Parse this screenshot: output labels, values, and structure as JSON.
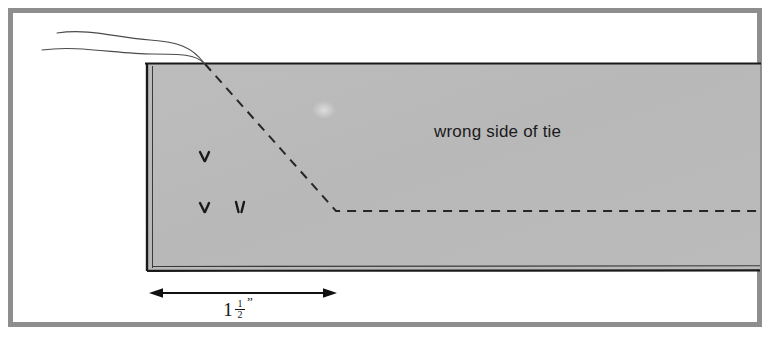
{
  "figure": {
    "kind": "sewing-instruction-diagram",
    "subject": "tie",
    "background_color": "#ffffff",
    "frame": {
      "name": "outer-border",
      "color": "#8e8e8e",
      "x": 8,
      "y": 8,
      "width": 752,
      "height": 318,
      "stroke_width": 5
    },
    "fabric": {
      "name": "tie-fabric-panel",
      "fill_color": "#b9b9b9",
      "outline_color": "#1a1a1a",
      "x": 146,
      "y": 63,
      "width": 614,
      "height": 208
    },
    "labels": {
      "fabric_side": "wrong side of tie"
    },
    "dimension": {
      "name": "seam-allowance-dimension",
      "whole": "1",
      "numerator": "1",
      "denominator": "2",
      "unit_mark": "”",
      "full_text": "1½”",
      "from_x": 150,
      "to_x": 336,
      "y": 293
    },
    "fold_line": {
      "name": "diagonal-fold-dashed-line",
      "style": "dashed",
      "color": "#262626",
      "points": "205,64 336,211 760,211"
    },
    "frayed_edge": {
      "name": "frayed-fabric-threads",
      "count": 2,
      "color": "#4a4a4a"
    },
    "nap_marks": {
      "name": "fabric-nap-marks",
      "glyph": "v",
      "count": 3,
      "color": "#1a1a1a",
      "positions": [
        {
          "x": 204,
          "y": 158
        },
        {
          "x": 204,
          "y": 209
        },
        {
          "x": 240,
          "y": 209
        }
      ]
    }
  }
}
